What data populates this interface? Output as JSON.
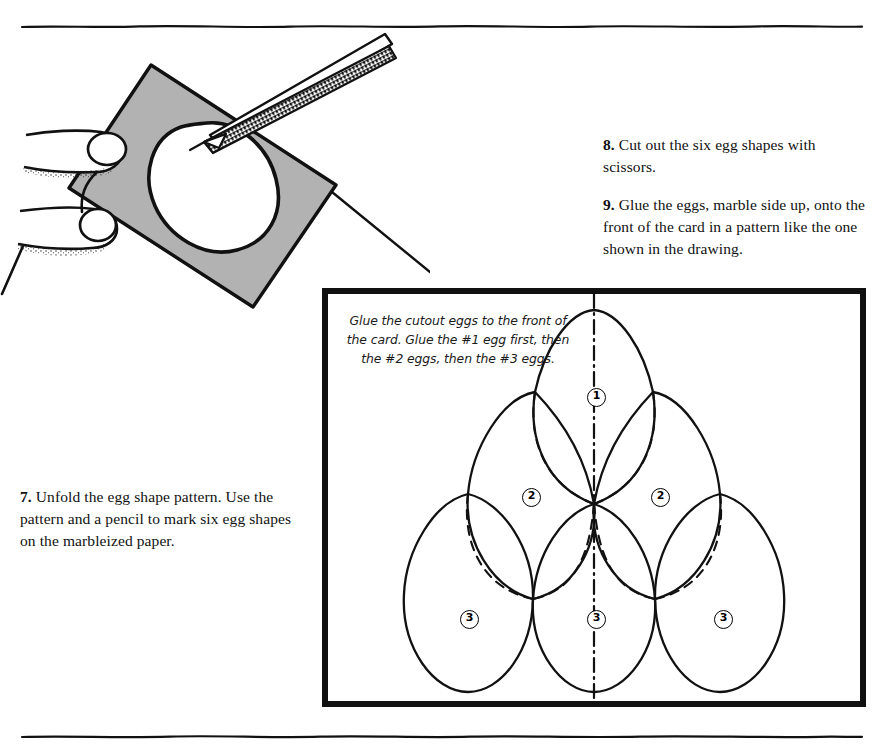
{
  "page": {
    "width": 883,
    "height": 756,
    "background": "#ffffff",
    "ink": "#000000",
    "paper_gray": "#b2b2b2"
  },
  "rules": {
    "top_label": "top-divider-rule",
    "bottom_label": "bottom-divider-rule"
  },
  "illustration": {
    "title": "hand-cutting-egg-shape-from-marbleized-paper",
    "parts": [
      "hand-with-two-fingers",
      "gray-marbleized-paper-square",
      "egg-shaped-cutout-opening",
      "scissors-blades"
    ]
  },
  "instructions": [
    {
      "id": "step-7",
      "number": "7.",
      "text": "Unfold the egg shape pattern. Use the pattern and a pencil to mark six egg shapes on the marbleized paper."
    },
    {
      "id": "step-8",
      "number": "8.",
      "text": "Cut out the six egg shapes with scissors."
    },
    {
      "id": "step-9",
      "number": "9.",
      "text": "Glue the eggs, marble side up, onto the front of the card in a pattern like the one shown in the drawing."
    }
  ],
  "diagram": {
    "name": "card-front-egg-layout",
    "caption": "Glue the cutout eggs to the front of the card. Glue the #1 egg first, then the #2 eggs, then the #3 eggs.",
    "frame": {
      "x": 322,
      "y": 288,
      "width": 544,
      "height": 419,
      "border_px": 6
    },
    "center_line": "dash-dot vertical fold line",
    "eggs": [
      {
        "label": "1",
        "row": "top",
        "position": "center",
        "badge_x": 265,
        "badge_y": 100
      },
      {
        "label": "2",
        "row": "middle",
        "position": "left",
        "badge_x": 200,
        "badge_y": 200
      },
      {
        "label": "2",
        "row": "middle",
        "position": "right",
        "badge_x": 329,
        "badge_y": 200
      },
      {
        "label": "3",
        "row": "bottom",
        "position": "left",
        "badge_x": 138,
        "badge_y": 322
      },
      {
        "label": "3",
        "row": "bottom",
        "position": "center",
        "badge_x": 265,
        "badge_y": 322
      },
      {
        "label": "3",
        "row": "bottom",
        "position": "right",
        "badge_x": 392,
        "badge_y": 322
      }
    ]
  }
}
